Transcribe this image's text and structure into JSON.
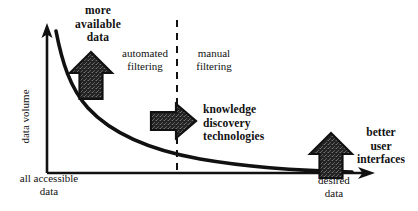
{
  "figure": {
    "type": "conceptual-diagram",
    "background_color": "#ffffff",
    "ink_color": "#111111"
  },
  "axes": {
    "y_axis": {
      "label": "data volume",
      "orientation": "vertical",
      "arrow_head": "up",
      "origin_px": [
        47,
        173
      ],
      "tip_px": [
        47,
        27
      ]
    },
    "x_axis": {
      "label_left": "all accessible\ndata",
      "label_right": "desired\ndata",
      "orientation": "horizontal",
      "arrow_head": "right",
      "origin_px": [
        47,
        173
      ],
      "tip_px": [
        374,
        173
      ]
    }
  },
  "curve": {
    "name": "data-volume-decay-curve",
    "description": "exponential decay from high data volume at all accessible data to low volume at desired data",
    "stroke_width": 3.4,
    "color": "#111111"
  },
  "divider": {
    "name": "filtering-divider",
    "style": "dashed",
    "x_px": 177,
    "y_top_px": 20,
    "y_bottom_px": 173
  },
  "regions": [
    {
      "id": "automated",
      "label": "automated\nfiltering",
      "bold": false
    },
    {
      "id": "manual",
      "label": "manual\nfiltering",
      "bold": false
    }
  ],
  "annotations": [
    {
      "id": "more-available-data",
      "label": "more\navailable\ndata",
      "bold": true,
      "arrow": {
        "direction": "up",
        "fill": "textured-dark"
      }
    },
    {
      "id": "knowledge-discovery-technologies",
      "label": "knowledge\ndiscovery\ntechnologies",
      "bold": true,
      "arrow": {
        "direction": "right",
        "fill": "textured-dark"
      }
    },
    {
      "id": "better-user-interfaces",
      "label": "better\nuser\ninterfaces",
      "bold": true,
      "arrow": {
        "direction": "up",
        "fill": "textured-dark"
      }
    }
  ],
  "labels": {
    "more_available_data": "more\navailable\ndata",
    "automated_filtering": "automated\nfiltering",
    "manual_filtering": "manual\nfiltering",
    "knowledge_discovery_technologies": "knowledge\ndiscovery\ntechnologies",
    "better_user_interfaces": "better\nuser\ninterfaces",
    "data_volume": "data volume",
    "all_accessible_data": "all accessible\ndata",
    "desired_data": "desired\ndata"
  }
}
